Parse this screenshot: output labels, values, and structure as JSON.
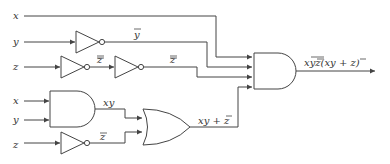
{
  "diagram": {
    "type": "logic-circuit",
    "colors": {
      "line": "#444444",
      "text": "#333333",
      "background": "#ffffff"
    },
    "top_section": {
      "inputs": [
        {
          "name": "x",
          "label": "x"
        },
        {
          "name": "y",
          "label": "y"
        },
        {
          "name": "z",
          "label": "z"
        }
      ],
      "gates": [
        {
          "id": "not-y",
          "type": "NOT",
          "input": "y",
          "output_label": "y"
        },
        {
          "id": "not-z1",
          "type": "NOT",
          "input": "z",
          "output_label": "z"
        },
        {
          "id": "not-z2",
          "type": "NOT",
          "input": "z̄",
          "output_label": "z"
        },
        {
          "id": "and-final",
          "type": "AND",
          "inputs": [
            "x",
            "ȳ",
            "z̿",
            "xy + z̄"
          ]
        }
      ],
      "labels": {
        "ybar": "y",
        "zbar1": "z",
        "zbar2": "z",
        "output": "xyz(xy + z)"
      }
    },
    "bottom_section": {
      "inputs": [
        {
          "name": "x",
          "label": "x"
        },
        {
          "name": "y",
          "label": "y"
        },
        {
          "name": "z",
          "label": "z"
        }
      ],
      "gates": [
        {
          "id": "and-xy",
          "type": "AND",
          "inputs": [
            "x",
            "y"
          ],
          "output_label": "xy"
        },
        {
          "id": "not-z-bottom",
          "type": "NOT",
          "input": "z",
          "output_label": "z̄"
        },
        {
          "id": "or-gate",
          "type": "OR",
          "inputs": [
            "xy",
            "z̄"
          ],
          "output_label": "xy + z̄"
        }
      ],
      "labels": {
        "xy": "xy",
        "zbar": "z",
        "or_out": "xy + z"
      }
    },
    "final_output_text": "xȳz̿(xy + z̄)"
  }
}
